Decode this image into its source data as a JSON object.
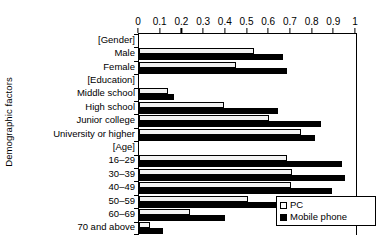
{
  "chart_data": {
    "type": "bar",
    "orientation": "horizontal",
    "title": "",
    "xlabel": "",
    "ylabel": "Demographic factors",
    "xlim": [
      0,
      1
    ],
    "xticks": [
      "0",
      "0.1",
      "0.2",
      "0.3",
      "0.4",
      "0.5",
      "0.6",
      "0.7",
      "0.8",
      "0.9",
      "1"
    ],
    "xtick_values": [
      0,
      0.1,
      0.2,
      0.3,
      0.4,
      0.5,
      0.6,
      0.7,
      0.8,
      0.9,
      1
    ],
    "grid": false,
    "legend_position": "bottom-right",
    "categories": [
      "[Gender]",
      "Male",
      "Female",
      "[Education]",
      "Middle school",
      "High school",
      "Junior college",
      "University or higher",
      "[Age]",
      "16–29",
      "30–39",
      "40–49",
      "50–59",
      "60–69",
      "70 and above"
    ],
    "category_is_header": [
      true,
      false,
      false,
      true,
      false,
      false,
      false,
      false,
      true,
      false,
      false,
      false,
      false,
      false,
      false
    ],
    "series": [
      {
        "name": "PC",
        "color": "#ffffff",
        "edgecolor": "#000000",
        "values": [
          null,
          0.53,
          0.445,
          null,
          0.135,
          0.39,
          0.6,
          0.745,
          null,
          0.68,
          0.705,
          0.7,
          0.5,
          0.235,
          0.05
        ]
      },
      {
        "name": "Mobile phone",
        "color": "#000000",
        "edgecolor": "#000000",
        "values": [
          null,
          0.665,
          0.68,
          null,
          0.16,
          0.64,
          0.84,
          0.81,
          null,
          0.935,
          0.95,
          0.89,
          0.765,
          0.395,
          0.11
        ]
      }
    ]
  },
  "legend": {
    "items": [
      {
        "label": "PC",
        "swatch": "open-square-icon"
      },
      {
        "label": "Mobile phone",
        "swatch": "filled-square-icon"
      }
    ]
  }
}
